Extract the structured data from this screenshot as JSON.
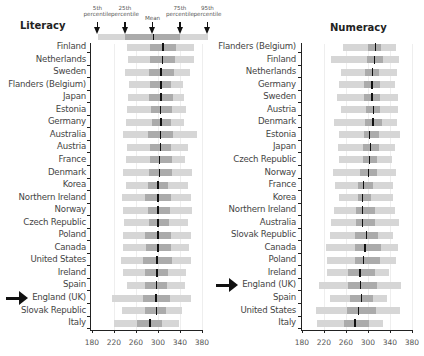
{
  "legend": {
    "labels": [
      "5th\npercentile",
      "25th\npercentile",
      "Mean",
      "75th\npercentile",
      "95th\npercentile"
    ],
    "p5": 190,
    "p25": 240,
    "mean": 290,
    "p75": 340,
    "p95": 390
  },
  "colors": {
    "outer": "#d6d6d6",
    "inner": "#ababab",
    "mean": "#111111",
    "axis": "#222222"
  },
  "chart_data": [
    {
      "type": "bar",
      "title": "Literacy",
      "xlabel": "",
      "ylabel": "",
      "xlim": [
        180,
        380
      ],
      "xticks": [
        180,
        220,
        260,
        300,
        340,
        380
      ],
      "grid": true,
      "highlight": "England (UK)",
      "categories": [
        "Finland",
        "Netherlands",
        "Sweden",
        "Flanders (Belgium)",
        "Japan",
        "Estonia",
        "Germany",
        "Australia",
        "Austria",
        "France",
        "Denmark",
        "Korea",
        "Northern Ireland",
        "Norway",
        "Czech Republic",
        "Poland",
        "Canada",
        "United States",
        "Ireland",
        "Spain",
        "England (UK)",
        "Slovak Republic",
        "Italy"
      ],
      "series": [
        {
          "name": "5th percentile",
          "values": [
            243,
            245,
            240,
            248,
            246,
            244,
            242,
            237,
            244,
            241,
            236,
            242,
            235,
            236,
            238,
            237,
            236,
            232,
            236,
            243,
            216,
            235,
            220
          ]
        },
        {
          "name": "25th percentile",
          "values": [
            285,
            285,
            283,
            285,
            284,
            288,
            289,
            281,
            285,
            286,
            284,
            282,
            277,
            281,
            283,
            276,
            278,
            272,
            276,
            277,
            272,
            277,
            261
          ]
        },
        {
          "name": "Mean",
          "values": [
            308,
            307,
            304,
            304,
            304,
            303,
            304,
            303,
            303,
            302,
            301,
            299,
            299,
            299,
            299,
            299,
            299,
            297,
            297,
            296,
            295,
            296,
            284
          ]
        },
        {
          "name": "75th percentile",
          "values": [
            333,
            330,
            329,
            324,
            327,
            325,
            324,
            327,
            323,
            325,
            326,
            319,
            323,
            322,
            320,
            324,
            323,
            325,
            318,
            316,
            322,
            315,
            307
          ]
        },
        {
          "name": "95th percentile",
          "values": [
            366,
            366,
            358,
            346,
            348,
            351,
            348,
            371,
            355,
            349,
            362,
            354,
            360,
            362,
            355,
            360,
            357,
            360,
            351,
            349,
            360,
            343,
            339
          ]
        }
      ]
    },
    {
      "type": "bar",
      "title": "Numeracy",
      "xlabel": "",
      "ylabel": "",
      "xlim": [
        180,
        380
      ],
      "xticks": [
        180,
        220,
        260,
        300,
        340,
        380
      ],
      "grid": true,
      "highlight": "England (UK)",
      "categories": [
        "Flanders (Belgium)",
        "Finland",
        "Netherlands",
        "Germany",
        "Sweden",
        "Austria",
        "Denmark",
        "Estonia",
        "Japan",
        "Czech Republic",
        "Norway",
        "France",
        "Korea",
        "Northern Ireland",
        "Australia",
        "Slovak Republic",
        "Canada",
        "Poland",
        "Ireland",
        "England (UK)",
        "Spain",
        "United States",
        "Italy"
      ],
      "series": [
        {
          "name": "5th percentile",
          "values": [
            255,
            232,
            250,
            248,
            244,
            250,
            239,
            248,
            246,
            248,
            237,
            240,
            247,
            238,
            232,
            230,
            224,
            225,
            226,
            210,
            230,
            206,
            208
          ]
        },
        {
          "name": "25th percentile",
          "values": [
            300,
            299,
            294,
            293,
            293,
            297,
            294,
            292,
            290,
            290,
            285,
            281,
            282,
            279,
            278,
            277,
            276,
            276,
            264,
            264,
            268,
            261,
            256
          ]
        },
        {
          "name": "Mean",
          "values": [
            312,
            311,
            307,
            306,
            306,
            309,
            308,
            301,
            303,
            302,
            300,
            291,
            289,
            289,
            289,
            296,
            293,
            291,
            284,
            285,
            287,
            281,
            275
          ]
        },
        {
          "name": "75th percentile",
          "values": [
            323,
            327,
            320,
            322,
            321,
            322,
            325,
            320,
            320,
            317,
            317,
            310,
            305,
            313,
            313,
            319,
            323,
            321,
            312,
            316,
            309,
            314,
            302
          ]
        },
        {
          "name": "95th percentile",
          "values": [
            350,
            356,
            352,
            350,
            355,
            355,
            352,
            358,
            349,
            344,
            351,
            345,
            345,
            349,
            357,
            345,
            354,
            350,
            338,
            360,
            334,
            358,
            328
          ]
        }
      ]
    }
  ]
}
